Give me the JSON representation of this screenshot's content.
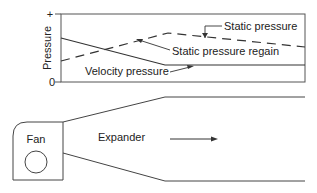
{
  "chart": {
    "y_axis_label": "Pressure",
    "y_tick_top": "+",
    "y_tick_bottom": "0",
    "labels": {
      "static_pressure": "Static pressure",
      "static_pressure_regain": "Static pressure regain",
      "velocity_pressure": "Velocity pressure"
    }
  },
  "duct": {
    "fan_label": "Fan",
    "expander_label": "Expander"
  },
  "colors": {
    "line": "#333333",
    "frame": "#555555",
    "text": "#222222"
  }
}
